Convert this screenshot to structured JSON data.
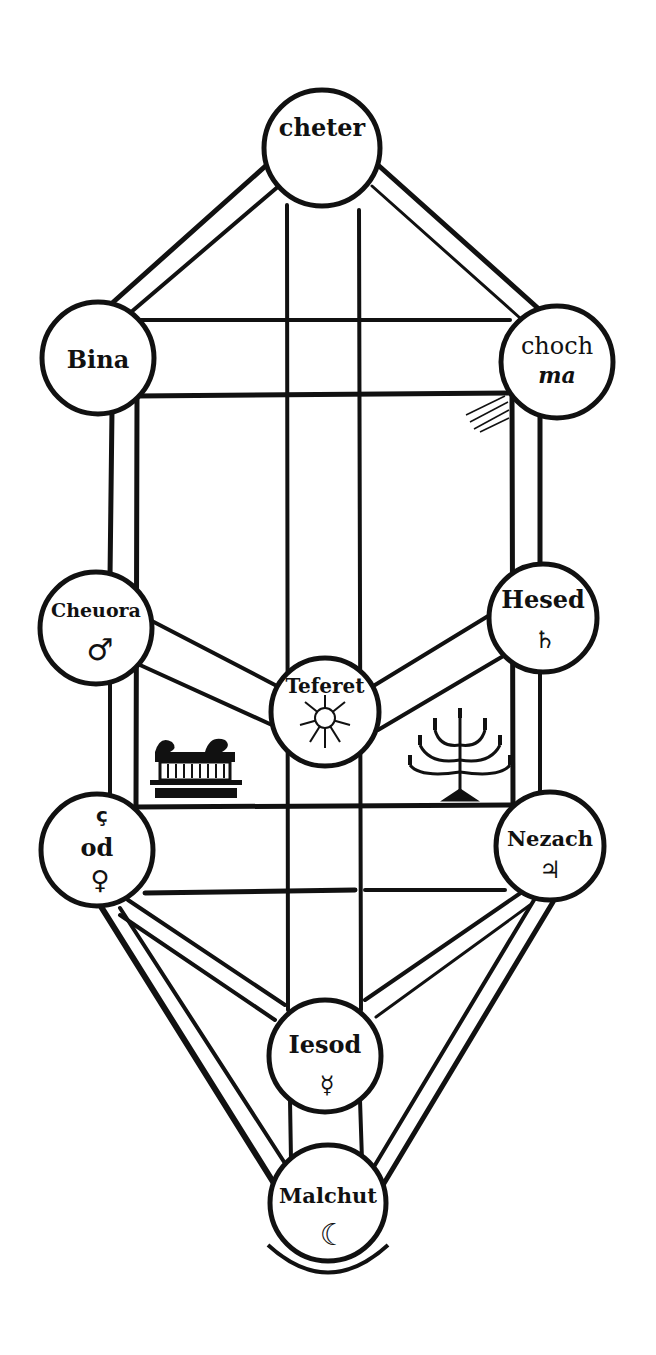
{
  "diagram": {
    "colors": {
      "ink": "#111111",
      "paper": "#ffffff"
    },
    "sephirot": [
      {
        "id": "keter",
        "label": "cheter",
        "label_line2": "",
        "symbol": "",
        "symbol_name": "",
        "cx": 322,
        "cy": 148,
        "r": 58
      },
      {
        "id": "binah",
        "label": "Bina",
        "label_line2": "",
        "symbol": "",
        "symbol_name": "",
        "cx": 98,
        "cy": 358,
        "r": 56
      },
      {
        "id": "chokhmah",
        "label": "choch",
        "label_line2": "ma",
        "symbol": "",
        "symbol_name": "",
        "cx": 557,
        "cy": 362,
        "r": 56
      },
      {
        "id": "gevurah",
        "label": "Cheuora",
        "label_line2": "",
        "symbol": "♂",
        "symbol_name": "mars-symbol",
        "cx": 96,
        "cy": 628,
        "r": 56
      },
      {
        "id": "chesed",
        "label": "Hesed",
        "label_line2": "",
        "symbol": "♄",
        "symbol_name": "saturn-symbol",
        "cx": 543,
        "cy": 618,
        "r": 54
      },
      {
        "id": "tiferet",
        "label": "Teferet",
        "label_line2": "",
        "symbol": "☼",
        "symbol_name": "sun-face-symbol",
        "cx": 325,
        "cy": 712,
        "r": 54
      },
      {
        "id": "hod",
        "label": "od",
        "label_line2": "",
        "symbol": "♀",
        "symbol_name": "venus-symbol",
        "cx": 97,
        "cy": 850,
        "r": 56,
        "prefix": "ç"
      },
      {
        "id": "netzach",
        "label": "Nezach",
        "label_line2": "",
        "symbol": "♃",
        "symbol_name": "jupiter-symbol",
        "cx": 550,
        "cy": 846,
        "r": 54
      },
      {
        "id": "yesod",
        "label": "Iesod",
        "label_line2": "",
        "symbol": "☿",
        "symbol_name": "mercury-symbol",
        "cx": 325,
        "cy": 1056,
        "r": 56
      },
      {
        "id": "malkuth",
        "label": "Malchut",
        "label_line2": "",
        "symbol": "☾",
        "symbol_name": "moon-face-symbol",
        "cx": 328,
        "cy": 1203,
        "r": 58
      }
    ],
    "illustrations": [
      {
        "id": "ark",
        "name": "ark-of-covenant-illustration",
        "glyph": "⛩",
        "x": 195,
        "y": 768
      },
      {
        "id": "menorah",
        "name": "menorah-illustration",
        "glyph": "🕎",
        "x": 460,
        "y": 758
      }
    ]
  }
}
